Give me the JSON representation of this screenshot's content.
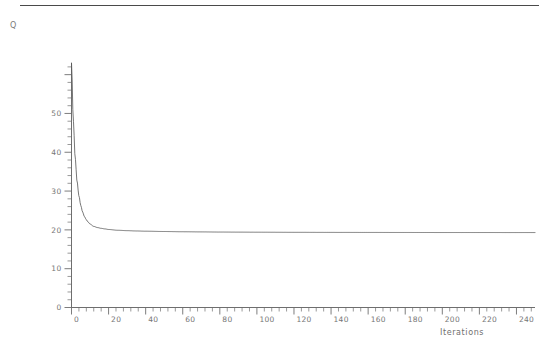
{
  "figure": {
    "ylabel": "Q",
    "xlabel": "Iterations",
    "top_rule": "top-border-rule"
  },
  "chart_data": {
    "type": "line",
    "title": "",
    "subtitle": "",
    "xlabel": "Iterations",
    "ylabel": "Q",
    "grid": false,
    "legend": false,
    "legend_position": "none",
    "xlim": [
      0,
      250
    ],
    "ylim": [
      0,
      63
    ],
    "x_major_step": 20,
    "x_minor_step": 4,
    "y_major_step": 10,
    "y_minor_step": 2,
    "xticklabels": [
      "0",
      "20",
      "40",
      "60",
      "80",
      "100",
      "120",
      "140",
      "160",
      "180",
      "200",
      "220",
      "240"
    ],
    "xtickvalues": [
      0,
      20,
      40,
      60,
      80,
      100,
      120,
      140,
      160,
      180,
      200,
      220,
      240
    ],
    "yticklabels": [
      "0",
      "10",
      "20",
      "30",
      "40",
      "50"
    ],
    "ytickvalues": [
      0,
      10,
      20,
      30,
      40,
      50
    ],
    "line_color": "#545454",
    "line_width": 0.8,
    "series": [
      {
        "name": "Q",
        "x": [
          0,
          1,
          2,
          3,
          4,
          5,
          6,
          7,
          8,
          9,
          10,
          12,
          14,
          16,
          18,
          20,
          25,
          30,
          35,
          40,
          50,
          60,
          70,
          80,
          90,
          100,
          120,
          140,
          160,
          180,
          200,
          220,
          240,
          250
        ],
        "values": [
          63.0,
          48.0,
          38.5,
          32.5,
          28.8,
          26.3,
          24.6,
          23.4,
          22.6,
          22.0,
          21.5,
          20.9,
          20.6,
          20.4,
          20.25,
          20.1,
          19.9,
          19.8,
          19.72,
          19.66,
          19.58,
          19.52,
          19.48,
          19.44,
          19.42,
          19.4,
          19.37,
          19.35,
          19.34,
          19.33,
          19.32,
          19.32,
          19.31,
          19.31
        ]
      }
    ],
    "annotations": [],
    "asymptote": 19.3,
    "start_value": 63.0
  }
}
